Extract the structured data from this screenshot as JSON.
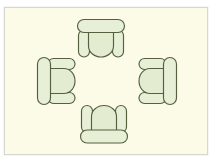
{
  "diagram": {
    "type": "furniture-layout",
    "room": {
      "label": "room-floor",
      "background_color": "#fbfbe8",
      "border_color": "#d6d7d2",
      "x": 4,
      "y": 7,
      "width": 204,
      "height": 148
    },
    "palette": {
      "sofa_fill": "#e7efd6",
      "sofa_seat_fill": "#e3ecd0",
      "sofa_outline": "#55603f",
      "page_background": "#ffffff"
    },
    "items": [
      {
        "id": "sofa-top",
        "label": "Sofa (top, facing down)",
        "orientation": "south-facing",
        "back_side": "top",
        "seats": 2,
        "x": 77,
        "y": 19,
        "width": 48,
        "height": 38
      },
      {
        "id": "sofa-left",
        "label": "Sofa (left, facing right)",
        "orientation": "east-facing",
        "back_side": "left",
        "seats": 2,
        "x": 37,
        "y": 57,
        "width": 38,
        "height": 48
      },
      {
        "id": "sofa-right",
        "label": "Sofa (right, facing left)",
        "orientation": "west-facing",
        "back_side": "right",
        "seats": 2,
        "x": 138,
        "y": 57,
        "width": 38,
        "height": 48
      },
      {
        "id": "sofa-bottom",
        "label": "Sofa (bottom, facing up)",
        "orientation": "north-facing",
        "back_side": "bottom",
        "seats": 2,
        "x": 80,
        "y": 105,
        "width": 48,
        "height": 38
      }
    ],
    "center_space": {
      "label": "open-center-area",
      "x": 80,
      "y": 60,
      "width": 58,
      "height": 44
    }
  }
}
